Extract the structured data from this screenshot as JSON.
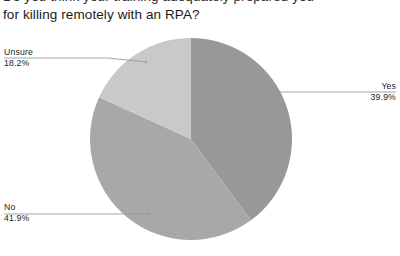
{
  "title": {
    "line1": "Do you think your training adequately prepared you",
    "line2": "for killing remotely with an RPA?"
  },
  "chart_data": {
    "type": "pie",
    "title": "Do you think your training adequately prepared you for killing remotely with an RPA?",
    "categories": [
      "Yes",
      "No",
      "Unsure"
    ],
    "values": [
      39.9,
      41.9,
      18.2
    ],
    "value_labels": [
      "39.9%",
      "41.9%",
      "18.2%"
    ],
    "unit": "%",
    "start_angle_deg": 0,
    "direction": "clockwise",
    "legend": "callout-labels",
    "grid": false,
    "colors": [
      "#989898",
      "#a8a8a8",
      "#c9c9c9"
    ],
    "slices": [
      {
        "name": "Yes",
        "value": 39.9,
        "label": "Yes",
        "percent_label": "39.9%",
        "color": "#989898",
        "angle_deg": 143.6
      },
      {
        "name": "No",
        "value": 41.9,
        "label": "No",
        "percent_label": "41.9%",
        "color": "#a8a8a8",
        "angle_deg": 150.8
      },
      {
        "name": "Unsure",
        "value": 18.2,
        "label": "Unsure",
        "percent_label": "18.2%",
        "color": "#c9c9c9",
        "angle_deg": 65.5
      }
    ]
  },
  "callouts": {
    "unsure": {
      "label": "Unsure",
      "percent": "18.2%"
    },
    "yes": {
      "label": "Yes",
      "percent": "39.9%"
    },
    "no": {
      "label": "No",
      "percent": "41.9%"
    }
  },
  "style": {
    "leader_line_color": "#9a9a9a",
    "background": "#ffffff"
  }
}
